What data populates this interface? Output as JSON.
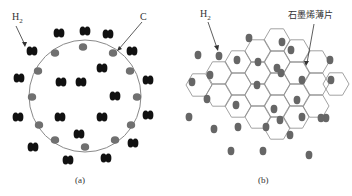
{
  "figure": {
    "panel_a": {
      "caption": "(a)",
      "labels": {
        "h2": "H",
        "h2_sub": "2",
        "carbon": "C"
      },
      "circle": {
        "cx": 85,
        "cy": 96,
        "r": 56,
        "stroke": "#8a8a8a"
      },
      "carbon_color": "#707070",
      "h2_color": "#111111",
      "carbon_atoms": [
        [
          83,
          47
        ],
        [
          55,
          53
        ],
        [
          113,
          53
        ],
        [
          38,
          71
        ],
        [
          130,
          71
        ],
        [
          32,
          97
        ],
        [
          137,
          97
        ],
        [
          39,
          125
        ],
        [
          131,
          125
        ],
        [
          55,
          140
        ],
        [
          115,
          140
        ],
        [
          85,
          147
        ]
      ],
      "h2_molecules": [
        [
          59,
          33
        ],
        [
          85,
          31
        ],
        [
          108,
          34
        ],
        [
          32,
          51
        ],
        [
          132,
          51
        ],
        [
          102,
          68
        ],
        [
          19,
          78
        ],
        [
          61,
          82
        ],
        [
          81,
          82
        ],
        [
          148,
          80
        ],
        [
          115,
          96
        ],
        [
          18,
          117
        ],
        [
          60,
          117
        ],
        [
          102,
          117
        ],
        [
          148,
          115
        ],
        [
          79,
          134
        ],
        [
          133,
          143
        ],
        [
          33,
          147
        ],
        [
          68,
          160
        ],
        [
          106,
          158
        ]
      ]
    },
    "panel_b": {
      "caption": "(b)",
      "labels": {
        "h2": "H",
        "h2_sub": "2",
        "graphene": "石墨烯薄片"
      },
      "hex_stroke": "#8a8a8a",
      "dot_color": "#666666",
      "hexagons": [
        [
          82,
          51
        ],
        [
          101,
          40
        ],
        [
          62,
          62
        ],
        [
          82,
          73
        ],
        [
          101,
          62
        ],
        [
          121,
          51
        ],
        [
          140,
          62
        ],
        [
          43,
          73
        ],
        [
          23,
          85
        ],
        [
          62,
          84
        ],
        [
          101,
          84
        ],
        [
          121,
          73
        ],
        [
          140,
          84
        ],
        [
          160,
          84
        ],
        [
          43,
          95
        ],
        [
          82,
          95
        ],
        [
          121,
          95
        ],
        [
          62,
          106
        ],
        [
          101,
          106
        ],
        [
          140,
          106
        ],
        [
          82,
          117
        ],
        [
          101,
          128
        ],
        [
          120,
          117
        ]
      ],
      "h2_dots": [
        [
          73,
          38
        ],
        [
          22,
          55
        ],
        [
          43,
          56
        ],
        [
          61,
          60
        ],
        [
          82,
          62
        ],
        [
          106,
          42
        ],
        [
          115,
          50
        ],
        [
          101,
          68
        ],
        [
          105,
          73
        ],
        [
          16,
          82
        ],
        [
          34,
          75
        ],
        [
          126,
          80
        ],
        [
          154,
          60
        ],
        [
          155,
          80
        ],
        [
          81,
          85
        ],
        [
          31,
          99
        ],
        [
          60,
          105
        ],
        [
          121,
          100
        ],
        [
          98,
          109
        ],
        [
          13,
          117
        ],
        [
          38,
          129
        ],
        [
          62,
          127
        ],
        [
          90,
          127
        ],
        [
          150,
          118
        ],
        [
          145,
          118
        ],
        [
          126,
          117
        ],
        [
          114,
          135
        ],
        [
          55,
          151
        ],
        [
          87,
          151
        ],
        [
          133,
          155
        ],
        [
          104,
          120
        ]
      ]
    }
  }
}
